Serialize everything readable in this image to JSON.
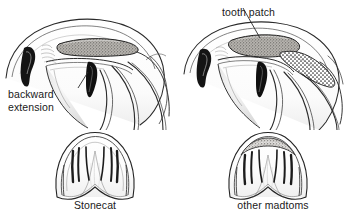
{
  "figure": {
    "background_color": "#ffffff",
    "ink_color": "#1a1a1a",
    "stipple_fill": "#8f8f8f",
    "width": 355,
    "height": 224
  },
  "annotations": {
    "backward_extension": "backward\nextension",
    "tooth_patch": "tooth patch"
  },
  "panels": [
    {
      "id": "left-lateral",
      "view": "lateral-cutaway-head",
      "species": "Stonecat",
      "tooth_patch_shape": "elongate-oval, no backward extension"
    },
    {
      "id": "right-lateral",
      "view": "lateral-cutaway-head",
      "species": "other madtoms",
      "tooth_patch_shape": "oval with crescent backward extension"
    },
    {
      "id": "left-ventral",
      "view": "ventral-tooth-patch",
      "species": "Stonecat"
    },
    {
      "id": "right-ventral",
      "view": "ventral-tooth-patch",
      "species": "other madtoms"
    }
  ],
  "captions": {
    "left": "Stonecat",
    "right": "other madtoms"
  }
}
